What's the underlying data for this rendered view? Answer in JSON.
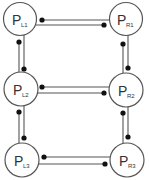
{
  "diagram": {
    "colors": {
      "stroke": "#555555",
      "dot": "#111111",
      "text": "#333333",
      "background": "#ffffff"
    },
    "nodes": [
      {
        "id": "L1",
        "main": "P",
        "sub": "L1",
        "cx": 20,
        "cy": 19,
        "r": 16.5
      },
      {
        "id": "R1",
        "main": "P",
        "sub": "R1",
        "cx": 126,
        "cy": 19,
        "r": 16.5
      },
      {
        "id": "L2",
        "main": "P",
        "sub": "L2",
        "cx": 21,
        "cy": 89,
        "r": 17
      },
      {
        "id": "R2",
        "main": "P",
        "sub": "R2",
        "cx": 126,
        "cy": 90,
        "r": 17
      },
      {
        "id": "L3",
        "main": "P",
        "sub": "L3",
        "cx": 22,
        "cy": 160,
        "r": 17
      },
      {
        "id": "R3",
        "main": "P",
        "sub": "R3",
        "cx": 127,
        "cy": 160,
        "r": 17
      }
    ],
    "links": [
      {
        "from": "L1",
        "to": "R1",
        "orientation": "horizontal"
      },
      {
        "from": "L2",
        "to": "R2",
        "orientation": "horizontal"
      },
      {
        "from": "L3",
        "to": "R3",
        "orientation": "horizontal"
      },
      {
        "from": "L1",
        "to": "L2",
        "orientation": "vertical"
      },
      {
        "from": "L2",
        "to": "L3",
        "orientation": "vertical"
      },
      {
        "from": "R1",
        "to": "R2",
        "orientation": "vertical"
      },
      {
        "from": "R2",
        "to": "R3",
        "orientation": "vertical"
      }
    ]
  }
}
